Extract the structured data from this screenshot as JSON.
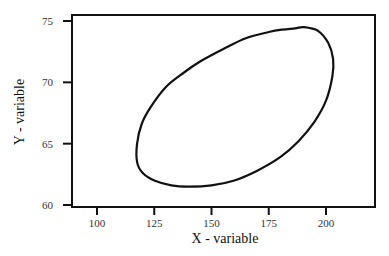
{
  "chart_data": {
    "type": "line",
    "subtype": "closed-contour (confidence ellipse)",
    "title": "",
    "xlabel": "X - variable",
    "ylabel": "Y - variable",
    "xlim": [
      90,
      221
    ],
    "ylim": [
      59.8,
      75.5
    ],
    "xticks": [
      100,
      125,
      150,
      175,
      200
    ],
    "yticks": [
      60,
      65,
      70,
      75
    ],
    "grid": false,
    "legend": null,
    "series": [
      {
        "name": "ellipse",
        "closed": true,
        "color": "#111111",
        "points": [
          [
            186.5,
            74.4
          ],
          [
            190.4,
            74.5
          ],
          [
            196.5,
            74.2
          ],
          [
            201.0,
            73.2
          ],
          [
            203.1,
            71.9
          ],
          [
            202.8,
            70.5
          ],
          [
            200.0,
            68.5
          ],
          [
            195.0,
            66.8
          ],
          [
            188.0,
            65.2
          ],
          [
            180.0,
            63.9
          ],
          [
            170.0,
            62.8
          ],
          [
            160.0,
            62.0
          ],
          [
            150.0,
            61.6
          ],
          [
            140.0,
            61.5
          ],
          [
            132.5,
            61.6
          ],
          [
            125.0,
            62.0
          ],
          [
            120.0,
            62.6
          ],
          [
            117.5,
            63.5
          ],
          [
            117.5,
            65.0
          ],
          [
            119.5,
            66.6
          ],
          [
            123.5,
            68.0
          ],
          [
            130.0,
            69.6
          ],
          [
            138.0,
            70.8
          ],
          [
            145.0,
            71.7
          ],
          [
            155.0,
            72.7
          ],
          [
            165.0,
            73.6
          ],
          [
            175.0,
            74.1
          ],
          [
            181.0,
            74.3
          ]
        ]
      }
    ]
  }
}
